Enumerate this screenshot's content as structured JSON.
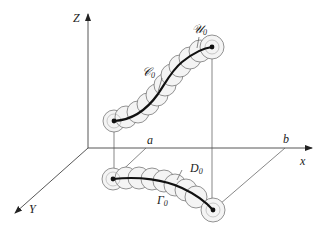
{
  "figure": {
    "axes": {
      "z_label": "Z",
      "x_label": "x",
      "y_label": "Y"
    },
    "points": {
      "a_label": "a",
      "b_label": "b"
    },
    "upper_tube": {
      "curve_label": "𝒞",
      "curve_subscript": "0",
      "neighborhood_label": "𝒰",
      "neighborhood_subscript": "0"
    },
    "lower_tube": {
      "curve_label": "Γ",
      "curve_subscript": "0",
      "neighborhood_label": "D",
      "neighborhood_subscript": "0"
    }
  }
}
